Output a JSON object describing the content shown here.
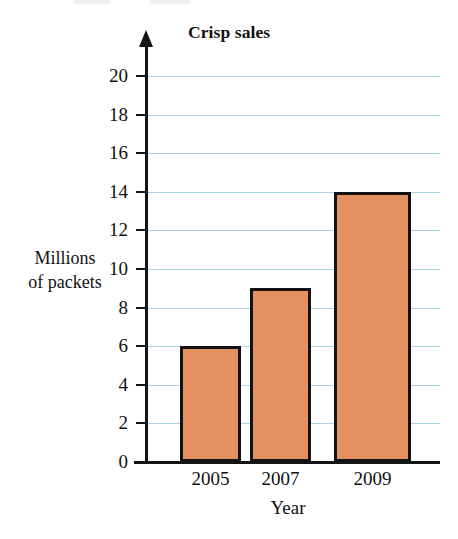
{
  "chart_data": {
    "type": "bar",
    "title": "Crisp sales",
    "xlabel": "Year",
    "ylabel": "Millions of packets",
    "ylabel_line1": "Millions",
    "ylabel_line2": "of packets",
    "categories": [
      "2005",
      "2007",
      "2009"
    ],
    "values": [
      6,
      9,
      14
    ],
    "ylim": [
      0,
      20
    ],
    "ytick_step": 2,
    "yticks": [
      0,
      2,
      4,
      6,
      8,
      10,
      12,
      14,
      16,
      18,
      20
    ],
    "ytick_labels": [
      "0",
      "2",
      "4",
      "6",
      "8",
      "10",
      "12",
      "14",
      "16",
      "18",
      "20"
    ],
    "grid": true,
    "grid_axis": "y",
    "legend": false,
    "series": [
      {
        "name": "Crisp sales",
        "values": [
          6,
          9,
          14
        ]
      }
    ],
    "colors": {
      "bar_fill": "#E59060",
      "bar_border": "#131313",
      "gridline": "#A8D4E8",
      "axis": "#141414",
      "background": "#FFFFFF",
      "text": "#111111"
    }
  }
}
